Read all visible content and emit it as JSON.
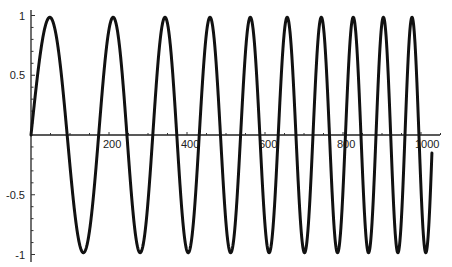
{
  "chart_data": {
    "type": "line",
    "title": "",
    "xlabel": "",
    "ylabel": "",
    "function_description": "chirp: y = sin(a*x + b*x^2), frequency increasing with x",
    "phase_coefficients": {
      "a": 0.03119,
      "b": 2.897e-05
    },
    "x_range": [
      0,
      1028
    ],
    "xlim": [
      0,
      1060
    ],
    "ylim": [
      -1,
      1
    ],
    "x_ticks": [
      200,
      400,
      600,
      800,
      1000
    ],
    "x_tick_labels": [
      "200",
      "400",
      "600",
      "800",
      "1000"
    ],
    "x_minor_step": 50,
    "y_ticks": [
      1,
      0.5,
      -0.5,
      -1
    ],
    "y_tick_labels": [
      "1",
      "0.5",
      "-0.5",
      "-1"
    ],
    "y_minor_step": 0.1,
    "grid": false,
    "legend": null,
    "series": [
      {
        "name": "signal",
        "color": "#111111",
        "peaks_x": [
          54,
          215,
          349,
          459,
          567,
          659,
          746,
          826,
          903,
          977
        ],
        "troughs_x": [
          136,
          279,
          403,
          511,
          611,
          700,
          786,
          864,
          939,
          1013
        ],
        "end_point": {
          "x": 1028,
          "y": -0.13
        }
      }
    ]
  },
  "layout": {
    "origin_px": [
      31,
      135
    ],
    "px_per_x_unit": 0.39,
    "px_per_y_unit": 119.5,
    "x_axis_end_px": 440,
    "y_axis_top_px": 10,
    "y_axis_bottom_px": 262
  }
}
